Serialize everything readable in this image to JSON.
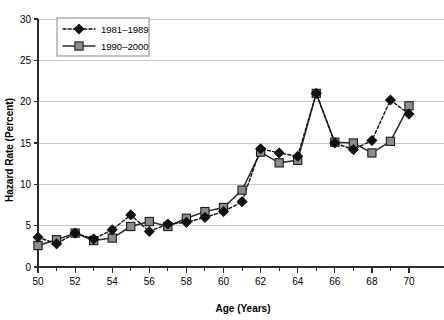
{
  "chart_data": {
    "type": "line",
    "title": "",
    "xlabel": "Age (Years)",
    "ylabel": "Hazard Rate (Percent)",
    "xlim": [
      50,
      70
    ],
    "ylim": [
      0,
      30
    ],
    "grid": true,
    "legend_position": "top-left",
    "x_ticks_major": [
      50,
      52,
      54,
      56,
      58,
      60,
      62,
      64,
      66,
      68,
      70
    ],
    "x_ticks_minor": [
      51,
      53,
      55,
      57,
      59,
      61,
      63,
      65,
      67,
      69
    ],
    "y_ticks": [
      0,
      5,
      10,
      15,
      20,
      25,
      30
    ],
    "x": [
      50,
      51,
      52,
      53,
      54,
      55,
      56,
      57,
      58,
      59,
      60,
      61,
      62,
      63,
      64,
      65,
      66,
      67,
      68,
      69,
      70
    ],
    "series": [
      {
        "name": "1981–1989",
        "marker": "diamond",
        "marker_color": "#111111",
        "line_style": "dotted",
        "line_color": "#111111",
        "values": [
          3.6,
          2.8,
          4.1,
          3.4,
          4.5,
          6.3,
          4.3,
          5.2,
          5.4,
          6.0,
          6.7,
          7.9,
          14.3,
          13.8,
          13.4,
          21.0,
          15.0,
          14.2,
          15.3,
          20.2,
          18.5
        ]
      },
      {
        "name": "1990–2000",
        "marker": "square",
        "marker_color": "#8c8c8c",
        "line_style": "solid",
        "line_color": "#2a2a2a",
        "values": [
          2.6,
          3.3,
          4.1,
          3.2,
          3.5,
          4.9,
          5.5,
          4.9,
          5.9,
          6.7,
          7.2,
          9.3,
          13.9,
          12.6,
          12.9,
          21.0,
          15.1,
          15.0,
          13.8,
          15.2,
          19.5
        ]
      }
    ]
  },
  "legend": {
    "entries": [
      {
        "label": "1981–1989"
      },
      {
        "label": "1990–2000"
      }
    ]
  },
  "colors": {
    "gridline": "#c9c9c9",
    "axis": "#2b2b2b",
    "series_a": "#111111",
    "series_b": "#8c8c8c",
    "background": "#ffffff"
  }
}
